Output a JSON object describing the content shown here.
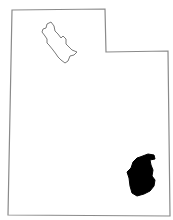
{
  "map": {
    "region": "Utah",
    "highlighted_area": "San Juan County (southeast)",
    "colors": {
      "background": "#ffffff",
      "state_outline": "#8a8a8a",
      "lake_outline": "#7a7a7a",
      "highlight_fill": "#000000"
    },
    "features": [
      "state-outline",
      "great-salt-lake",
      "highlighted-county"
    ]
  }
}
